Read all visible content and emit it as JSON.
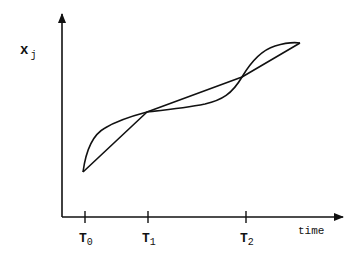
{
  "diagram": {
    "y_axis_label": "x",
    "y_axis_label_sub": "j",
    "x_axis_label": "time",
    "ticks": [
      {
        "label": "T",
        "sub": "0"
      },
      {
        "label": "T",
        "sub": "1"
      },
      {
        "label": "T",
        "sub": "2"
      }
    ],
    "curves": [
      {
        "name": "piecewise-linear-approximation",
        "description": "straight line segments joining sample points at T0, T1, T2"
      },
      {
        "name": "smooth-trajectory",
        "description": "smooth curve crossing the line at T1 and T2"
      }
    ],
    "colors": {
      "stroke": "#111111",
      "background": "#ffffff"
    }
  }
}
